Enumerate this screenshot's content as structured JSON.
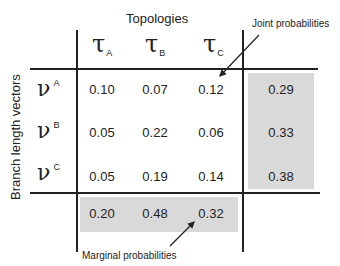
{
  "column_header": "Topologies",
  "row_header": "Branch length vectors",
  "columns": [
    {
      "symbol": "τ",
      "subscript": "A"
    },
    {
      "symbol": "τ",
      "subscript": "B"
    },
    {
      "symbol": "τ",
      "subscript": "C"
    }
  ],
  "rows": [
    {
      "symbol": "ν",
      "superscript": "A",
      "values": [
        "0.10",
        "0.07",
        "0.12"
      ],
      "marginal": "0.29"
    },
    {
      "symbol": "ν",
      "superscript": "B",
      "values": [
        "0.05",
        "0.22",
        "0.06"
      ],
      "marginal": "0.33"
    },
    {
      "symbol": "ν",
      "superscript": "C",
      "values": [
        "0.05",
        "0.19",
        "0.14"
      ],
      "marginal": "0.38"
    }
  ],
  "column_marginals": [
    "0.20",
    "0.48",
    "0.32"
  ],
  "annotations": {
    "joint": "Joint probabilities",
    "marginal": "Marginal probabilities"
  },
  "colors": {
    "shade": "#d9d9d9",
    "lines": "#222222"
  }
}
